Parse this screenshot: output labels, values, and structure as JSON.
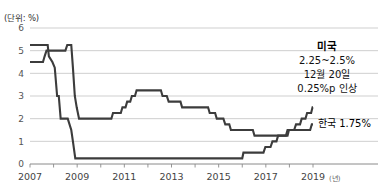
{
  "chart_data": {
    "type": "line",
    "title": "",
    "unit_label": "(단위: %)",
    "xlabel": "(년)",
    "ylabel": "",
    "xlim": [
      2007.0,
      2019.0
    ],
    "ylim": [
      0,
      6
    ],
    "yticks": [
      "0",
      "1",
      "2",
      "3",
      "4",
      "5",
      "6"
    ],
    "xticks": [
      "2007",
      "2009",
      "2011",
      "2013",
      "2015",
      "2017",
      "2019"
    ],
    "xtick_values": [
      2007,
      2009,
      2011,
      2013,
      2015,
      2017,
      2019
    ],
    "grid": true,
    "grid_axis": "y",
    "legend_position": "inline-annotation",
    "series": [
      {
        "name": "미국",
        "color": "#3c3c3c",
        "points": [
          [
            2007.0,
            5.25
          ],
          [
            2007.75,
            5.25
          ],
          [
            2007.8,
            4.75
          ],
          [
            2007.95,
            4.5
          ],
          [
            2008.05,
            4.25
          ],
          [
            2008.15,
            3.0
          ],
          [
            2008.22,
            3.0
          ],
          [
            2008.3,
            2.0
          ],
          [
            2008.6,
            2.0
          ],
          [
            2008.75,
            1.5
          ],
          [
            2008.82,
            1.0
          ],
          [
            2008.92,
            0.25
          ],
          [
            2016.0,
            0.25
          ],
          [
            2016.05,
            0.5
          ],
          [
            2016.9,
            0.5
          ],
          [
            2016.98,
            0.75
          ],
          [
            2017.2,
            0.75
          ],
          [
            2017.28,
            1.0
          ],
          [
            2017.45,
            1.0
          ],
          [
            2017.52,
            1.25
          ],
          [
            2017.92,
            1.25
          ],
          [
            2017.98,
            1.5
          ],
          [
            2018.2,
            1.5
          ],
          [
            2018.28,
            1.75
          ],
          [
            2018.45,
            1.75
          ],
          [
            2018.52,
            2.0
          ],
          [
            2018.68,
            2.0
          ],
          [
            2018.75,
            2.25
          ],
          [
            2018.92,
            2.25
          ],
          [
            2018.98,
            2.5
          ],
          [
            2019.0,
            2.5
          ]
        ]
      },
      {
        "name": "한국",
        "color": "#3c3c3c",
        "points": [
          [
            2007.0,
            4.5
          ],
          [
            2007.55,
            4.5
          ],
          [
            2007.62,
            4.75
          ],
          [
            2007.7,
            5.0
          ],
          [
            2008.5,
            5.0
          ],
          [
            2008.58,
            5.25
          ],
          [
            2008.75,
            5.25
          ],
          [
            2008.82,
            4.25
          ],
          [
            2008.9,
            3.0
          ],
          [
            2008.98,
            2.5
          ],
          [
            2009.08,
            2.0
          ],
          [
            2010.45,
            2.0
          ],
          [
            2010.52,
            2.25
          ],
          [
            2010.85,
            2.25
          ],
          [
            2010.92,
            2.5
          ],
          [
            2011.05,
            2.5
          ],
          [
            2011.12,
            2.75
          ],
          [
            2011.25,
            2.75
          ],
          [
            2011.32,
            3.0
          ],
          [
            2011.45,
            3.0
          ],
          [
            2011.52,
            3.25
          ],
          [
            2012.55,
            3.25
          ],
          [
            2012.62,
            3.0
          ],
          [
            2012.8,
            3.0
          ],
          [
            2012.88,
            2.75
          ],
          [
            2013.38,
            2.75
          ],
          [
            2013.45,
            2.5
          ],
          [
            2014.55,
            2.5
          ],
          [
            2014.62,
            2.25
          ],
          [
            2014.85,
            2.25
          ],
          [
            2014.92,
            2.0
          ],
          [
            2015.2,
            2.0
          ],
          [
            2015.28,
            1.75
          ],
          [
            2015.45,
            1.75
          ],
          [
            2015.52,
            1.5
          ],
          [
            2016.45,
            1.5
          ],
          [
            2016.52,
            1.25
          ],
          [
            2017.85,
            1.25
          ],
          [
            2017.92,
            1.5
          ],
          [
            2018.88,
            1.5
          ],
          [
            2018.95,
            1.75
          ],
          [
            2019.0,
            1.75
          ]
        ]
      }
    ],
    "annotations": [
      {
        "id": "us-annotation",
        "lines": [
          "미국",
          "2.25~2.5%",
          "12월 20일",
          "0.25%p 인상"
        ],
        "series": "미국"
      },
      {
        "id": "kr-annotation",
        "lines": [
          "한국 1.75%"
        ],
        "series": "한국"
      }
    ]
  },
  "colors": {
    "line": "#3c3c3c",
    "grid": "#c9c9c9",
    "axis": "#8a8a8a",
    "text": "#111111"
  }
}
